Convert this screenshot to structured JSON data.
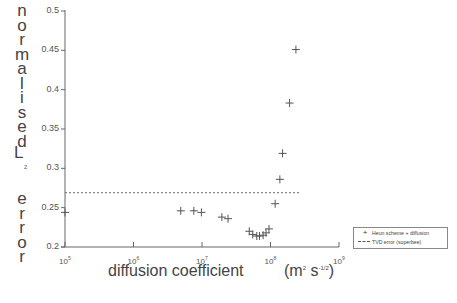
{
  "chart_data": {
    "type": "scatter",
    "title": "",
    "xlabel": "diffusion    coefficient",
    "xlabel_units": "(m² s^-1/2)",
    "xlabel_units_parts": {
      "open": "(m",
      "sup1": "2",
      "mid": " s",
      "sup2": "-1/2",
      "close": ")"
    },
    "ylabel_letters": [
      "n",
      "o",
      "r",
      "m",
      "a",
      "l",
      "i",
      "s",
      "e",
      "d"
    ],
    "ylabel_L": "L",
    "ylabel_sub": "2",
    "ylabel_error_letters": [
      "e",
      "r",
      "r",
      "o",
      "r"
    ],
    "ylabel": "normalised L2 error",
    "xscale": "log",
    "xlim": [
      100000,
      1000000000
    ],
    "ylim": [
      0.2,
      0.5
    ],
    "grid": false,
    "x_ticks": [
      {
        "base": "10",
        "exp": "5"
      },
      {
        "base": "10",
        "exp": "6"
      },
      {
        "base": "10",
        "exp": "7"
      },
      {
        "base": "10",
        "exp": "8"
      },
      {
        "base": "10",
        "exp": "9"
      }
    ],
    "y_ticks": [
      "0.5",
      "0.45",
      "0.4",
      "0.35",
      "0.3",
      "0.25",
      "0.2"
    ],
    "legend_position": "lower right, outside plot",
    "series": [
      {
        "name": "Heun scheme + diffusion",
        "marker": "+",
        "x": [
          100000,
          4900000,
          7600000,
          9800000,
          19500000,
          24000000,
          49000000,
          55000000,
          63000000,
          69000000,
          78000000,
          86000000,
          95000000,
          117000000,
          137000000,
          150000000,
          190000000,
          235000000
        ],
        "y": [
          0.244,
          0.246,
          0.246,
          0.244,
          0.238,
          0.236,
          0.22,
          0.216,
          0.214,
          0.214,
          0.215,
          0.218,
          0.223,
          0.255,
          0.286,
          0.319,
          0.383,
          0.451
        ]
      },
      {
        "name": "TVD error (superbee)",
        "style": "dashed",
        "type": "hline",
        "y": 0.269,
        "x_range": [
          100000,
          240000000
        ]
      }
    ]
  },
  "legend": {
    "items": [
      {
        "symbol": "+",
        "label": "Heun scheme + diffusion"
      },
      {
        "symbol": "----",
        "label": "TVD error (superbee)"
      }
    ]
  }
}
